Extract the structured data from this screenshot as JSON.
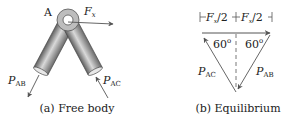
{
  "figure": {
    "panel_a": {
      "caption": "(a) Free body",
      "joint_label": "A",
      "force_x": {
        "symbol": "F",
        "subscript": "x"
      },
      "force_ab": {
        "symbol": "P",
        "subscript": "AB"
      },
      "force_ac": {
        "symbol": "P",
        "subscript": "AC"
      }
    },
    "panel_b": {
      "caption": "(b) Equilibrium",
      "dim_left": {
        "symbol": "F",
        "subscript": "x",
        "suffix": "/2"
      },
      "dim_right": {
        "symbol": "F",
        "subscript": "x",
        "suffix": "/2"
      },
      "angle_left": "60",
      "angle_right": "60",
      "degree": "o",
      "force_ac": {
        "symbol": "P",
        "subscript": "AC"
      },
      "force_ab": {
        "symbol": "P",
        "subscript": "AB"
      }
    }
  },
  "colors": {
    "line": "#555555",
    "member_dark": "#6e6e6e",
    "member_light": "#d8d8d8",
    "text": "#222222"
  }
}
